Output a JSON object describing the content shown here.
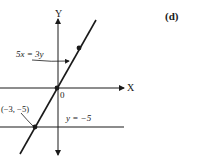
{
  "panel_label": "(d)",
  "axes": {
    "x_label": "X",
    "y_label": "Y",
    "origin_label": "0"
  },
  "lines": [
    {
      "equation": "5x = 3y",
      "type": "slanted"
    },
    {
      "equation": "y = −5",
      "type": "horizontal"
    }
  ],
  "points": [
    {
      "label": "(−3, −5)",
      "x": -3,
      "y": -5
    },
    {
      "label": "",
      "x": 0,
      "y": 0
    },
    {
      "label": "",
      "x": 3,
      "y": 5
    }
  ],
  "colors": {
    "ink": "#1a1a1a",
    "background": "#ffffff"
  }
}
